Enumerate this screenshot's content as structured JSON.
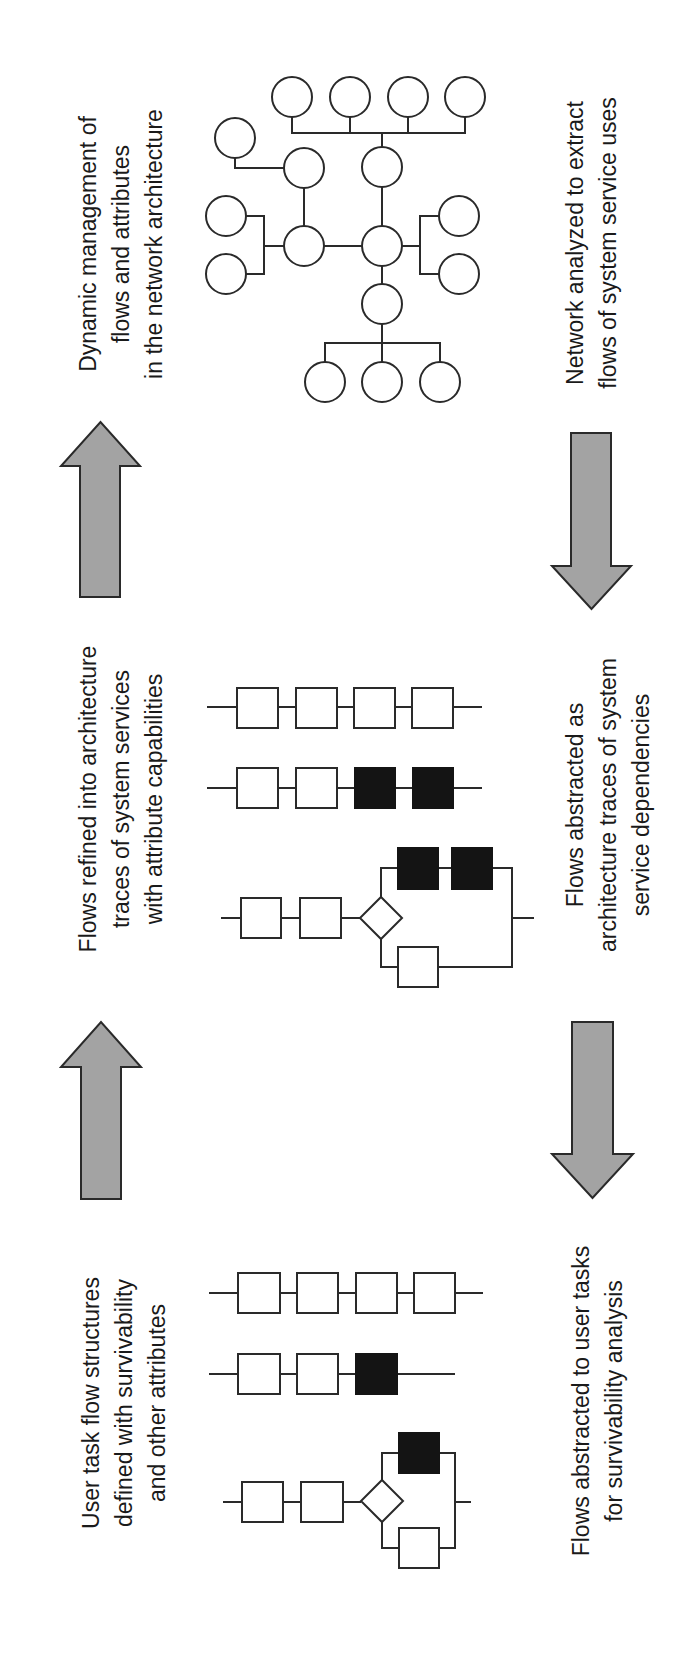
{
  "figure": {
    "background": "#ffffff",
    "arrow_fill": "#a3a3a3",
    "node_fill_filled": "#141414",
    "line_color": "#2a2a2a",
    "font_size": 23,
    "line_spacing": 33
  },
  "labels": [
    {
      "id": "label-dynamic-management",
      "cx": 96,
      "cy": 244,
      "lines": [
        "Dynamic management of",
        "flows and attributes",
        "in the network architecture"
      ]
    },
    {
      "id": "label-network-analyzed",
      "cx": 583,
      "cy": 243,
      "lines": [
        "Network analyzed to extract",
        "flows of system service uses"
      ]
    },
    {
      "id": "label-flows-refined",
      "cx": 96,
      "cy": 799,
      "lines": [
        "Flows refined into architecture",
        "traces of system services",
        "with attribute capabilities"
      ]
    },
    {
      "id": "label-flows-abstracted-architecture",
      "cx": 583,
      "cy": 805,
      "lines": [
        "Flows abstracted as",
        "architecture traces of system",
        "service dependencies"
      ]
    },
    {
      "id": "label-user-task-flow",
      "cx": 99,
      "cy": 1403,
      "lines": [
        "User task flow structures",
        "defined with survivability",
        "and other attributes"
      ]
    },
    {
      "id": "label-flows-abstracted-user-tasks",
      "cx": 589,
      "cy": 1401,
      "lines": [
        "Flows abstracted to user tasks",
        "for survivability analysis"
      ]
    }
  ],
  "arrows": [
    {
      "id": "arrow-up-top",
      "direction": "up",
      "shaft_x": [
        80,
        120
      ],
      "head_x": [
        61,
        140
      ],
      "tip_y": 422,
      "head_base_y": 466,
      "tail_y": 597
    },
    {
      "id": "arrow-down-top",
      "direction": "down",
      "shaft_x": [
        571,
        611
      ],
      "head_x": [
        552,
        631
      ],
      "tip_y": 609,
      "head_base_y": 566,
      "tail_y": 433
    },
    {
      "id": "arrow-up-bottom",
      "direction": "up",
      "shaft_x": [
        81,
        121
      ],
      "head_x": [
        61,
        141
      ],
      "tip_y": 1022,
      "head_base_y": 1067,
      "tail_y": 1199
    },
    {
      "id": "arrow-down-bottom",
      "direction": "down",
      "shaft_x": [
        572,
        613
      ],
      "head_x": [
        552,
        633
      ],
      "tip_y": 1198,
      "head_base_y": 1154,
      "tail_y": 1022
    }
  ],
  "network": {
    "radius": 20,
    "nodes": [
      {
        "x": 292,
        "y": 97
      },
      {
        "x": 350,
        "y": 97
      },
      {
        "x": 408,
        "y": 97
      },
      {
        "x": 465,
        "y": 97
      },
      {
        "x": 235,
        "y": 138
      },
      {
        "x": 304,
        "y": 168
      },
      {
        "x": 382,
        "y": 167
      },
      {
        "x": 226,
        "y": 216
      },
      {
        "x": 226,
        "y": 274
      },
      {
        "x": 304,
        "y": 246
      },
      {
        "x": 382,
        "y": 246
      },
      {
        "x": 459,
        "y": 216
      },
      {
        "x": 459,
        "y": 274
      },
      {
        "x": 382,
        "y": 304
      },
      {
        "x": 325,
        "y": 382
      },
      {
        "x": 382,
        "y": 382
      },
      {
        "x": 440,
        "y": 382
      }
    ],
    "edges": [
      "M292,117 V133 H465 V117",
      "M350,117 V133",
      "M408,117 V133",
      "M382,133 V147",
      "M235,158 V168 H284",
      "M304,188 V226",
      "M382,187 V226",
      "M324,246 H362",
      "M246,216 H264 V274 H246",
      "M264,246 H284",
      "M439,216 H420 V274 H439",
      "M402,246 H420",
      "M382,266 V284",
      "M382,324 V343 H325 V362",
      "M382,343 V362",
      "M382,343 H440 V362"
    ]
  },
  "flows": [
    {
      "id": "architecture-trace-linear",
      "line": {
        "x1": 207,
        "x2": 482,
        "y": 707
      },
      "boxes": [
        {
          "x": 237,
          "y": 688,
          "w": 41,
          "h": 40,
          "filled": false
        },
        {
          "x": 296,
          "y": 688,
          "w": 41,
          "h": 40,
          "filled": false
        },
        {
          "x": 354,
          "y": 688,
          "w": 41,
          "h": 40,
          "filled": false
        },
        {
          "x": 412,
          "y": 688,
          "w": 41,
          "h": 40,
          "filled": false
        }
      ]
    },
    {
      "id": "architecture-trace-attributes",
      "line": {
        "x1": 207,
        "x2": 482,
        "y": 788
      },
      "boxes": [
        {
          "x": 237,
          "y": 768,
          "w": 41,
          "h": 40,
          "filled": false
        },
        {
          "x": 296,
          "y": 768,
          "w": 41,
          "h": 40,
          "filled": false
        },
        {
          "x": 355,
          "y": 768,
          "w": 40,
          "h": 40,
          "filled": true
        },
        {
          "x": 413,
          "y": 768,
          "w": 40,
          "h": 40,
          "filled": true
        }
      ]
    },
    {
      "id": "user-task-linear",
      "line": {
        "x1": 209,
        "x2": 483,
        "y": 1293
      },
      "boxes": [
        {
          "x": 238,
          "y": 1273,
          "w": 42,
          "h": 40,
          "filled": false
        },
        {
          "x": 297,
          "y": 1273,
          "w": 41,
          "h": 40,
          "filled": false
        },
        {
          "x": 356,
          "y": 1273,
          "w": 41,
          "h": 40,
          "filled": false
        },
        {
          "x": 414,
          "y": 1273,
          "w": 41,
          "h": 40,
          "filled": false
        }
      ]
    },
    {
      "id": "user-task-attributes",
      "line": {
        "x1": 209,
        "x2": 455,
        "y": 1374
      },
      "boxes": [
        {
          "x": 238,
          "y": 1354,
          "w": 42,
          "h": 40,
          "filled": false
        },
        {
          "x": 297,
          "y": 1354,
          "w": 41,
          "h": 40,
          "filled": false
        },
        {
          "x": 356,
          "y": 1354,
          "w": 41,
          "h": 40,
          "filled": true
        }
      ]
    }
  ],
  "branch_flows": [
    {
      "id": "architecture-trace-branch",
      "main_y": 918,
      "start_x": 221,
      "end_x": 534,
      "join_x": 512,
      "diamond": {
        "cx": 381,
        "cy": 918,
        "hw": 21,
        "hh": 21
      },
      "top_y": 868,
      "bottom_y": 967,
      "boxes": [
        {
          "x": 241,
          "y": 898,
          "w": 40,
          "h": 40,
          "filled": false
        },
        {
          "x": 300,
          "y": 898,
          "w": 41,
          "h": 40,
          "filled": false
        },
        {
          "x": 398,
          "y": 848,
          "w": 40,
          "h": 41,
          "filled": true
        },
        {
          "x": 452,
          "y": 848,
          "w": 40,
          "h": 41,
          "filled": true
        },
        {
          "x": 398,
          "y": 947,
          "w": 40,
          "h": 40,
          "filled": false
        }
      ]
    },
    {
      "id": "user-task-branch",
      "main_y": 1502,
      "start_x": 223,
      "end_x": 471,
      "join_x": 455,
      "diamond": {
        "cx": 382,
        "cy": 1501,
        "hw": 21,
        "hh": 21
      },
      "top_y": 1453,
      "bottom_y": 1548,
      "boxes": [
        {
          "x": 242,
          "y": 1482,
          "w": 41,
          "h": 40,
          "filled": false
        },
        {
          "x": 301,
          "y": 1482,
          "w": 42,
          "h": 40,
          "filled": false
        },
        {
          "x": 399,
          "y": 1433,
          "w": 40,
          "h": 40,
          "filled": true
        },
        {
          "x": 399,
          "y": 1528,
          "w": 40,
          "h": 40,
          "filled": false
        }
      ]
    }
  ]
}
